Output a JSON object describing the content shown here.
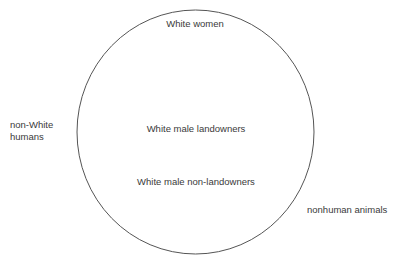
{
  "diagram": {
    "type": "circle-of-moral-consideration",
    "circle": {
      "stroke_color": "#555555"
    },
    "inside_labels": [
      {
        "id": "white-women",
        "text": "White women"
      },
      {
        "id": "white-male-landowners",
        "text": "White male landowners"
      },
      {
        "id": "white-male-non-landowners",
        "text": "White male non-landowners"
      }
    ],
    "outside_labels": [
      {
        "id": "non-white-humans",
        "lines": [
          "non-White",
          "humans"
        ]
      },
      {
        "id": "nonhuman-animals",
        "text": "nonhuman animals"
      }
    ]
  }
}
